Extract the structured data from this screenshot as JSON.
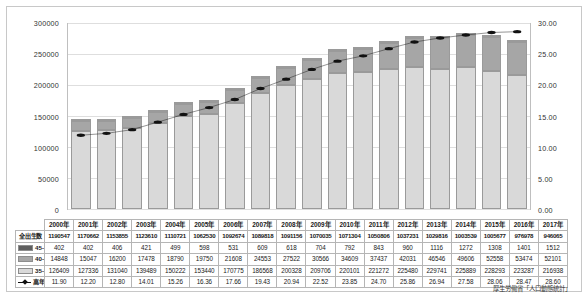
{
  "chart_data": {
    "type": "bar",
    "title": "",
    "xlabel": "",
    "ylabel": "",
    "grid": true,
    "legend_position": "table-left-column",
    "categories": [
      "2000年",
      "2001年",
      "2002年",
      "2003年",
      "2004年",
      "2005年",
      "2006年",
      "2007年",
      "2008年",
      "2009年",
      "2010年",
      "2011年",
      "2012年",
      "2013年",
      "2014年",
      "2015年",
      "2016年",
      "2017年"
    ],
    "left_axis": {
      "min": 0,
      "max": 300000,
      "step": 50000,
      "ticks": [
        "0",
        "50000",
        "100000",
        "150000",
        "200000",
        "250000",
        "300000"
      ]
    },
    "right_axis": {
      "min": 0,
      "max": 30,
      "step": 5,
      "ticks": [
        "0.00",
        "5.00",
        "10.00",
        "15.00",
        "20.00",
        "25.00",
        "30.00"
      ]
    },
    "series": [
      {
        "name": "35-39",
        "axis": "left",
        "type": "bar-stack",
        "color": "#d9d9d9",
        "values": [
          126409,
          127336,
          131040,
          139489,
          150222,
          153440,
          170775,
          186568,
          200328,
          209706,
          220101,
          221272,
          225480,
          229741,
          225889,
          228293,
          223287,
          216938
        ]
      },
      {
        "name": "40-44",
        "axis": "left",
        "type": "bar-stack",
        "color": "#a6a6a6",
        "values": [
          14848,
          15047,
          16200,
          17478,
          18790,
          19750,
          21608,
          24553,
          27522,
          30566,
          34609,
          37437,
          42031,
          46546,
          49606,
          52558,
          53474,
          52101
        ]
      },
      {
        "name": "45-",
        "axis": "left",
        "type": "bar-stack",
        "color": "#5f5f5f",
        "values": [
          402,
          402,
          406,
          421,
          499,
          598,
          531,
          609,
          618,
          704,
          792,
          843,
          960,
          1116,
          1272,
          1308,
          1401,
          1512
        ]
      },
      {
        "name": "高年妊娠率",
        "axis": "right",
        "type": "line",
        "color": "#111111",
        "values": [
          11.9,
          12.2,
          12.8,
          14.01,
          15.26,
          16.36,
          17.66,
          19.43,
          20.94,
          22.52,
          23.85,
          24.7,
          25.86,
          26.94,
          27.58,
          28.06,
          28.47,
          28.6
        ]
      }
    ],
    "total_row": {
      "name": "全出生数",
      "values": [
        1190547,
        1170662,
        1153855,
        1123610,
        1110721,
        1062530,
        1092674,
        1089818,
        1091156,
        1070035,
        1071304,
        1050806,
        1037231,
        1029816,
        1003539,
        1005677,
        976978,
        946065
      ]
    }
  },
  "table": {
    "row_labels": {
      "total": "全出生数",
      "s45": "45-",
      "s40": "40-44",
      "s35": "35-39",
      "rate": "高年妊娠率"
    }
  },
  "source": "厚生労働省「人口動態統計」"
}
